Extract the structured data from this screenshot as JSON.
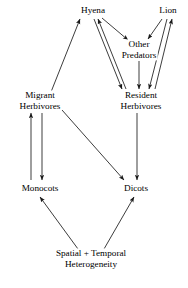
{
  "diagram": {
    "type": "food-web-flow-diagram",
    "background_color": "#ffffff",
    "line_color": "#1a1a1a",
    "text_color": "#000000",
    "nodes": [
      {
        "id": "hyena",
        "label_line1": "Hyena",
        "label_line2": "",
        "x": 93,
        "y": 10
      },
      {
        "id": "lion",
        "label_line1": "Lion",
        "label_line2": "",
        "x": 168,
        "y": 10
      },
      {
        "id": "other_pred",
        "label_line1": "Other",
        "label_line2": "Predators",
        "x": 139,
        "y": 50
      },
      {
        "id": "migrant_herb",
        "label_line1": "Migrant",
        "label_line2": "Herbivores",
        "x": 40,
        "y": 101
      },
      {
        "id": "resident_herb",
        "label_line1": "Resident",
        "label_line2": "Herbivores",
        "x": 141,
        "y": 101
      },
      {
        "id": "monocots",
        "label_line1": "Monocots",
        "label_line2": "",
        "x": 40,
        "y": 188
      },
      {
        "id": "dicots",
        "label_line1": "Dicots",
        "label_line2": "",
        "x": 136,
        "y": 188
      },
      {
        "id": "heterogeneity",
        "label_line1": "Spatial + Temporal",
        "label_line2": "Heterogeneity",
        "x": 91,
        "y": 259
      }
    ],
    "edges": [
      {
        "id": "migrant-to-hyena",
        "from": "migrant_herb",
        "to": "hyena",
        "direction": "one-way"
      },
      {
        "id": "hyena-to-other-predators",
        "from": "hyena",
        "to": "other_pred",
        "direction": "one-way"
      },
      {
        "id": "lion-to-other-predators",
        "from": "lion",
        "to": "other_pred",
        "direction": "one-way"
      },
      {
        "id": "other-predators-to-resident",
        "from": "other_pred",
        "to": "resident_herb",
        "direction": "one-way"
      },
      {
        "id": "hyena-resident-down",
        "from": "hyena",
        "to": "resident_herb",
        "direction": "one-way"
      },
      {
        "id": "resident-hyena-up",
        "from": "resident_herb",
        "to": "hyena",
        "direction": "one-way"
      },
      {
        "id": "lion-resident-down",
        "from": "lion",
        "to": "resident_herb",
        "direction": "one-way"
      },
      {
        "id": "resident-lion-up",
        "from": "resident_herb",
        "to": "lion",
        "direction": "one-way"
      },
      {
        "id": "monocots-to-migrant",
        "from": "monocots",
        "to": "migrant_herb",
        "direction": "one-way"
      },
      {
        "id": "migrant-to-monocots",
        "from": "migrant_herb",
        "to": "monocots",
        "direction": "one-way"
      },
      {
        "id": "migrant-to-dicots",
        "from": "migrant_herb",
        "to": "dicots",
        "direction": "one-way"
      },
      {
        "id": "resident-to-dicots",
        "from": "resident_herb",
        "to": "dicots",
        "direction": "one-way"
      },
      {
        "id": "heterogeneity-to-monocots",
        "from": "heterogeneity",
        "to": "monocots",
        "direction": "one-way"
      },
      {
        "id": "heterogeneity-to-dicots",
        "from": "heterogeneity",
        "to": "dicots",
        "direction": "one-way"
      }
    ]
  }
}
